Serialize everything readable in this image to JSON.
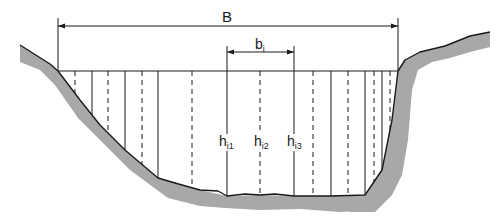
{
  "diagram": {
    "labels": {
      "total_width": "B",
      "sub_width_base": "b",
      "sub_width_sub": "i",
      "depth_base": "h",
      "depth_1_sub": "i1",
      "depth_2_sub": "i2",
      "depth_3_sub": "i3"
    },
    "colors": {
      "bank_fill": "#a8a8a8",
      "line": "#1a1a1a",
      "background": "#ffffff"
    },
    "water_surface_y": 71,
    "verticals": [
      {
        "x": 75,
        "style": "dashed"
      },
      {
        "x": 92,
        "style": "solid"
      },
      {
        "x": 108,
        "style": "dashed"
      },
      {
        "x": 125,
        "style": "solid"
      },
      {
        "x": 142,
        "style": "dashed"
      },
      {
        "x": 158,
        "style": "solid"
      },
      {
        "x": 192,
        "style": "dashed"
      },
      {
        "x": 227,
        "style": "solid",
        "label": "h_i1"
      },
      {
        "x": 260,
        "style": "dashed",
        "label": "h_i2"
      },
      {
        "x": 294,
        "style": "solid",
        "label": "h_i3"
      },
      {
        "x": 313,
        "style": "dashed"
      },
      {
        "x": 331,
        "style": "solid"
      },
      {
        "x": 348,
        "style": "dashed"
      },
      {
        "x": 365,
        "style": "solid"
      },
      {
        "x": 374,
        "style": "dashed"
      },
      {
        "x": 382,
        "style": "solid"
      },
      {
        "x": 390,
        "style": "dashed"
      }
    ],
    "dimension_B": {
      "x1": 58,
      "x2": 398,
      "y": 26
    },
    "dimension_bi": {
      "x1": 227,
      "x2": 294,
      "y": 52
    }
  }
}
